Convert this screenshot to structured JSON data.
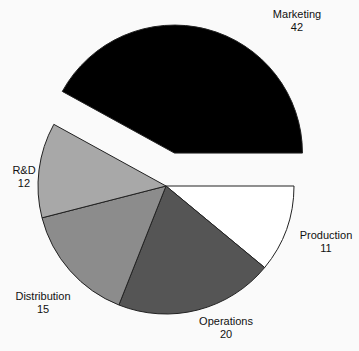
{
  "chart_data": {
    "type": "pie",
    "title": "",
    "categories": [
      "Production",
      "Operations",
      "Distribution",
      "R&D",
      "Marketing"
    ],
    "values": [
      11,
      20,
      15,
      12,
      42
    ],
    "colors": [
      "#ffffff",
      "#555555",
      "#8c8c8c",
      "#a8a8a8",
      "#000000"
    ],
    "exploded": [
      "Marketing"
    ],
    "start_angle_deg": 0,
    "direction": "clockwise",
    "legend": "none",
    "labels": [
      {
        "name": "Production",
        "value": "11"
      },
      {
        "name": "Operations",
        "value": "20"
      },
      {
        "name": "Distribution",
        "value": "15"
      },
      {
        "name": "R&D",
        "value": "12"
      },
      {
        "name": "Marketing",
        "value": "42"
      }
    ]
  },
  "layout": {
    "cx": 166,
    "cy": 186,
    "r": 128,
    "explode_offset": 34,
    "label_positions": [
      {
        "x": 326,
        "y": 229
      },
      {
        "x": 226,
        "y": 315
      },
      {
        "x": 43,
        "y": 290
      },
      {
        "x": 24,
        "y": 164
      },
      {
        "x": 297,
        "y": 8
      }
    ]
  }
}
